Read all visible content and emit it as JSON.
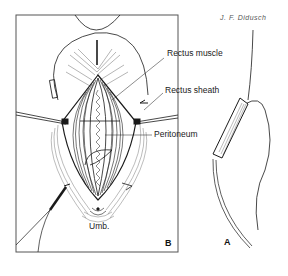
{
  "figure": {
    "signature": "J. F. Didusch",
    "panels": [
      {
        "id": "B",
        "letter": "B",
        "labels": [
          {
            "text": "Rectus muscle"
          },
          {
            "text": "Rectus sheath"
          },
          {
            "text": "Peritoneum"
          },
          {
            "text": "Umb."
          }
        ]
      },
      {
        "id": "A",
        "letter": "A"
      }
    ],
    "colors": {
      "ink": "#1a1a1a",
      "frame": "#555555",
      "background": "#ffffff"
    }
  }
}
